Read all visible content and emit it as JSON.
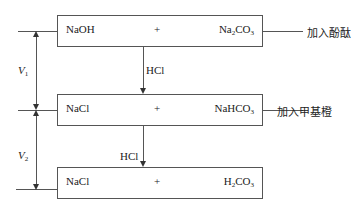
{
  "stages": [
    {
      "left": "NaOH",
      "plus": "+",
      "right_main": "Na",
      "right_sub1": "2",
      "right_mid": "CO",
      "right_sub2": "3",
      "note": "加入酚酞"
    },
    {
      "left": "NaCl",
      "plus": "+",
      "right_main": "NaHCO",
      "right_sub1": "3",
      "note": "加入甲基橙"
    },
    {
      "left": "NaCl",
      "plus": "+",
      "right_main": "H",
      "right_sub1": "2",
      "right_mid": "CO",
      "right_sub2": "3"
    }
  ],
  "reagents": [
    "HCl",
    "HCl"
  ],
  "volumes": [
    {
      "symbol": "V",
      "sub": "1"
    },
    {
      "symbol": "V",
      "sub": "2"
    }
  ]
}
